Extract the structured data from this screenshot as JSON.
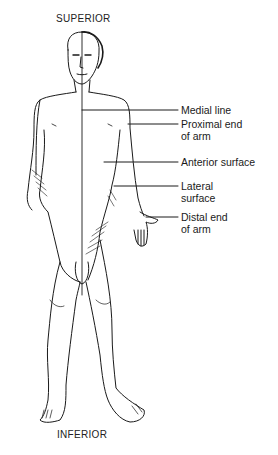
{
  "diagram": {
    "orientation": {
      "top": "SUPERIOR",
      "bottom": "INFERIOR"
    },
    "labels": [
      {
        "id": "medial-line",
        "text": "Medial line"
      },
      {
        "id": "proximal-end-of-arm",
        "text": "Proximal end\nof arm"
      },
      {
        "id": "anterior-surface",
        "text": "Anterior surface"
      },
      {
        "id": "lateral-surface",
        "text": "Lateral\nsurface"
      },
      {
        "id": "distal-end-of-arm",
        "text": "Distal end\nof arm"
      }
    ],
    "colors": {
      "ink": "#1a1a1a",
      "background": "#ffffff"
    }
  }
}
